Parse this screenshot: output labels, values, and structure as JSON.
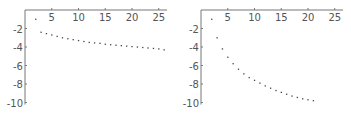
{
  "chart_data": [
    {
      "type": "scatter",
      "title": "",
      "xlabel": "",
      "ylabel": "",
      "xlim": [
        0,
        26
      ],
      "ylim": [
        -10,
        0
      ],
      "grid": false,
      "legend": null,
      "x_ticks": [
        5,
        10,
        15,
        20,
        25
      ],
      "y_ticks": [
        -2,
        -4,
        -6,
        -8,
        -10
      ],
      "x": [
        2,
        3,
        4,
        5,
        6,
        7,
        8,
        9,
        10,
        11,
        12,
        13,
        14,
        15,
        16,
        17,
        18,
        19,
        20,
        21,
        22,
        23,
        24,
        25,
        26
      ],
      "y": [
        -1.0,
        -2.4,
        -2.55,
        -2.7,
        -2.85,
        -3.0,
        -3.1,
        -3.2,
        -3.3,
        -3.4,
        -3.5,
        -3.55,
        -3.6,
        -3.7,
        -3.75,
        -3.8,
        -3.85,
        -3.9,
        -3.95,
        -4.0,
        -4.05,
        -4.1,
        -4.15,
        -4.2,
        -4.3
      ]
    },
    {
      "type": "scatter",
      "title": "",
      "xlabel": "",
      "ylabel": "",
      "xlim": [
        0,
        26
      ],
      "ylim": [
        -10,
        0
      ],
      "grid": false,
      "legend": null,
      "x_ticks": [
        5,
        10,
        15,
        20,
        25
      ],
      "y_ticks": [
        -2,
        -4,
        -6,
        -8,
        -10
      ],
      "x": [
        2,
        3,
        4,
        5,
        6,
        7,
        8,
        9,
        10,
        11,
        12,
        13,
        14,
        15,
        16,
        17,
        18,
        19,
        20,
        21
      ],
      "y": [
        -1.0,
        -3.0,
        -4.2,
        -5.1,
        -5.8,
        -6.4,
        -6.9,
        -7.3,
        -7.6,
        -7.9,
        -8.2,
        -8.45,
        -8.7,
        -8.9,
        -9.1,
        -9.3,
        -9.45,
        -9.6,
        -9.7,
        -9.8
      ]
    }
  ],
  "style": {
    "axis_color": "#777777",
    "point_color": "#444444",
    "label_color": "#555555"
  }
}
